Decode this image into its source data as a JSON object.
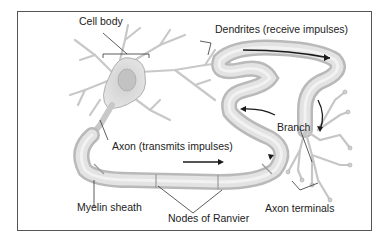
{
  "diagram": {
    "labels": {
      "cell_body": "Cell body",
      "dendrites": "Dendrites (receive impulses)",
      "axon": "Axon (transmits impulses)",
      "branch": "Branch",
      "myelin_sheath": "Myelin sheath",
      "nodes_of_ranvier": "Nodes of Ranvier",
      "axon_terminals": "Axon terminals"
    },
    "colors": {
      "frame": "#555555",
      "tissue_fill": "#e2e2e2",
      "tissue_stroke": "#b5b5b5",
      "leader_line": "#333333",
      "arrow": "#1a1a1a"
    }
  }
}
